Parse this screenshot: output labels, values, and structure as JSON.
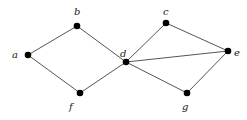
{
  "graph": {
    "nodes": [
      {
        "id": "a",
        "label": "a",
        "x": 28,
        "y": 55,
        "lx": 12,
        "ly": 58
      },
      {
        "id": "b",
        "label": "b",
        "x": 77,
        "y": 26,
        "lx": 74,
        "ly": 15
      },
      {
        "id": "f",
        "label": "f",
        "x": 80,
        "y": 93,
        "lx": 69,
        "ly": 110
      },
      {
        "id": "d",
        "label": "d",
        "x": 126,
        "y": 62,
        "lx": 120,
        "ly": 57
      },
      {
        "id": "c",
        "label": "c",
        "x": 166,
        "y": 23,
        "lx": 163,
        "ly": 15
      },
      {
        "id": "e",
        "label": "e",
        "x": 228,
        "y": 51,
        "lx": 234,
        "ly": 56
      },
      {
        "id": "g",
        "label": "g",
        "x": 187,
        "y": 93,
        "lx": 182,
        "ly": 110
      }
    ],
    "edges": [
      [
        "a",
        "b"
      ],
      [
        "b",
        "d"
      ],
      [
        "a",
        "f"
      ],
      [
        "f",
        "d"
      ],
      [
        "d",
        "c"
      ],
      [
        "c",
        "e"
      ],
      [
        "d",
        "e"
      ],
      [
        "d",
        "g"
      ],
      [
        "g",
        "e"
      ]
    ]
  }
}
